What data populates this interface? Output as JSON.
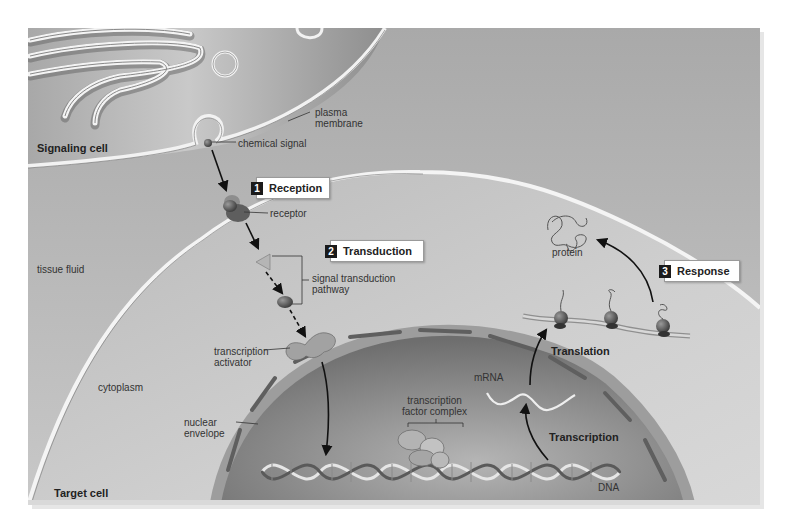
{
  "figure": {
    "colors": {
      "page_bg": "#ffffff",
      "signaling_cell_bg": "#9e9e9e",
      "tissue_fluid_bg": "#c4c4c4",
      "target_cytoplasm_bg": "#b2b2b2",
      "nucleus_bg": "#7d7d7d",
      "membrane": "#f2f2f2",
      "arrow": "#111111"
    }
  },
  "regions": {
    "signaling_cell": "Signaling cell",
    "target_cell": "Target cell",
    "tissue_fluid": "tissue fluid",
    "cytoplasm": "cytoplasm"
  },
  "labels": {
    "plasma_membrane_line1": "plasma",
    "plasma_membrane_line2": "membrane",
    "chemical_signal": "chemical signal",
    "receptor": "receptor",
    "signal_pathway_line1": "signal transduction",
    "signal_pathway_line2": "pathway",
    "transcription_activator_line1": "transcription",
    "transcription_activator_line2": "activator",
    "nuclear_envelope_line1": "nuclear",
    "nuclear_envelope_line2": "envelope",
    "tf_complex_line1": "transcription",
    "tf_complex_line2": "factor complex",
    "mrna": "mRNA",
    "dna": "DNA",
    "protein": "protein",
    "translation": "Translation",
    "transcription": "Transcription"
  },
  "steps": [
    {
      "number": "1",
      "label": "Reception"
    },
    {
      "number": "2",
      "label": "Transduction"
    },
    {
      "number": "3",
      "label": "Response"
    }
  ]
}
